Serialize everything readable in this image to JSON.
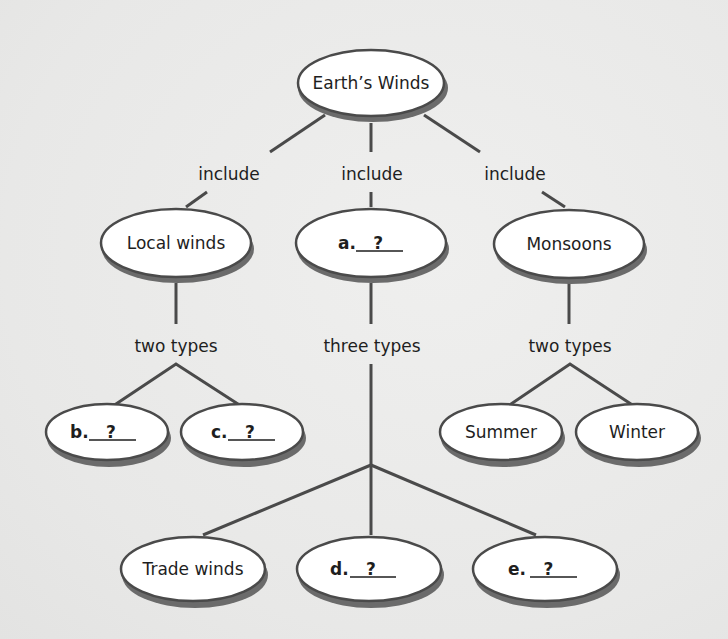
{
  "diagram": {
    "type": "concept-map",
    "root": {
      "label": "Earth’s Winds"
    },
    "link_labels": {
      "include_left": "include",
      "include_mid": "include",
      "include_right": "include",
      "types_left": "two types",
      "types_mid": "three types",
      "types_right": "two types"
    },
    "level1": [
      {
        "label": "Local winds"
      },
      {
        "letter": "a.",
        "blank": "?"
      },
      {
        "label": "Monsoons"
      }
    ],
    "local_winds_types": [
      {
        "letter": "b.",
        "blank": "?"
      },
      {
        "letter": "c.",
        "blank": "?"
      }
    ],
    "monsoon_types": [
      {
        "label": "Summer"
      },
      {
        "label": "Winter"
      }
    ],
    "a_types": [
      {
        "label": "Trade winds"
      },
      {
        "letter": "d.",
        "blank": "?"
      },
      {
        "letter": "e.",
        "blank": "?"
      }
    ]
  }
}
